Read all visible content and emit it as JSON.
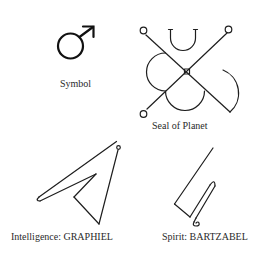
{
  "figures": [
    {
      "id": "symbol",
      "label": "Symbol",
      "glyph": "mars-symbol-icon"
    },
    {
      "id": "seal",
      "label": "Seal of Planet",
      "glyph": "seal-of-mars-icon"
    },
    {
      "id": "intelligence",
      "label": "Intelligence: GRAPHIEL",
      "glyph": "sigil-graphiel-icon"
    },
    {
      "id": "spirit",
      "label": "Spirit: BARTZABEL",
      "glyph": "sigil-bartzabel-icon"
    }
  ],
  "colors": {
    "background": "#ffffff",
    "ink": "#1e1e1e"
  }
}
